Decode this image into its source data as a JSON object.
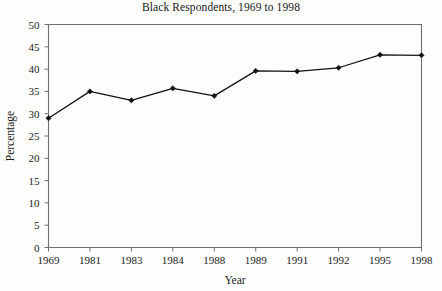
{
  "chart_data": {
    "type": "line",
    "title": "Black Respondents, 1969 to 1998",
    "xlabel": "Year",
    "ylabel": "Percentage",
    "categories": [
      "1969",
      "1981",
      "1983",
      "1984",
      "1988",
      "1989",
      "1991",
      "1992",
      "1995",
      "1998"
    ],
    "values": [
      29,
      35,
      33,
      35.7,
      34,
      39.6,
      39.5,
      40.3,
      43.2,
      43.1
    ],
    "series": [
      {
        "name": "Black Respondents",
        "values": [
          29,
          35,
          33,
          35.7,
          34,
          39.6,
          39.5,
          40.3,
          43.2,
          43.1
        ]
      }
    ],
    "ylim": [
      0,
      50
    ],
    "ytick_labels": [
      "0",
      "5",
      "10",
      "15",
      "20",
      "25",
      "30",
      "35",
      "40",
      "45",
      "50"
    ],
    "ytick_values": [
      0,
      5,
      10,
      15,
      20,
      25,
      30,
      35,
      40,
      45,
      50
    ],
    "xtick_labels": [
      "1969",
      "1981",
      "1983",
      "1984",
      "1988",
      "1989",
      "1991",
      "1992",
      "1995",
      "1998"
    ],
    "grid": false,
    "legend": "none",
    "marker": "diamond",
    "line_color": "#111111",
    "axis_color": "#6f6f6f",
    "background_color": "#fdfdfc"
  }
}
